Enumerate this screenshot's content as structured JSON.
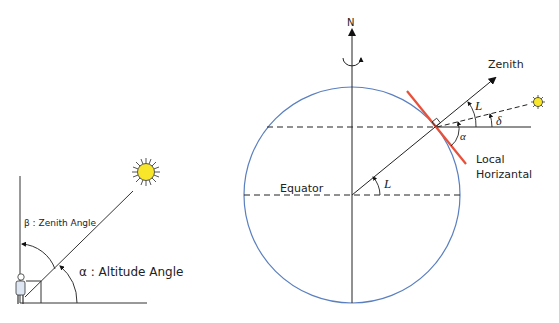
{
  "left_diagram": {
    "zenith_label": "β : Zenith Angle",
    "altitude_label": "α : Altitude Angle",
    "elements": [
      "observer-figure",
      "sun",
      "vertical-reference-line",
      "horizontal-ground-line",
      "sun-ray"
    ]
  },
  "right_diagram": {
    "north_label": "N",
    "zenith_label": "Zenith",
    "equator_label": "Equator",
    "latitude_label_center": "L",
    "latitude_label_observer": "L",
    "declination_label": "δ",
    "altitude_label": "α",
    "local_horizontal_label_line1": "Local",
    "local_horizontal_label_line2": "Horizantal",
    "colors": {
      "earth_outline": "#5a7fc0",
      "local_horizontal": "#e8503a",
      "sun_fill": "#f7e62a",
      "lines": "#222222"
    }
  }
}
